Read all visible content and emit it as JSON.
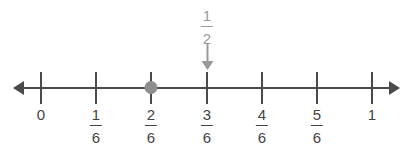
{
  "figure": {
    "type": "number-line",
    "background_color": "#ffffff",
    "axis_color": "#4a4a4a",
    "label_color": "#434343",
    "marker_color": "#8d8d8d",
    "callout_color": "#9a9a9a"
  },
  "axis": {
    "left_arrow": "left-arrow",
    "right_arrow": "right-arrow",
    "start_x": 41,
    "end_x": 372,
    "y": 88,
    "spacing": 55.2
  },
  "ticks": [
    {
      "x": 41,
      "is_fraction": false,
      "whole": "0",
      "numerator": "",
      "denominator": ""
    },
    {
      "x": 96,
      "is_fraction": true,
      "whole": "",
      "numerator": "1",
      "denominator": "6"
    },
    {
      "x": 151,
      "is_fraction": true,
      "whole": "",
      "numerator": "2",
      "denominator": "6"
    },
    {
      "x": 207,
      "is_fraction": true,
      "whole": "",
      "numerator": "3",
      "denominator": "6"
    },
    {
      "x": 262,
      "is_fraction": true,
      "whole": "",
      "numerator": "4",
      "denominator": "6"
    },
    {
      "x": 317,
      "is_fraction": true,
      "whole": "",
      "numerator": "5",
      "denominator": "6"
    },
    {
      "x": 372,
      "is_fraction": false,
      "whole": "1",
      "numerator": "",
      "denominator": ""
    }
  ],
  "point_marker": {
    "x": 151,
    "label": "2/6",
    "shape": "filled-circle"
  },
  "callout": {
    "x": 207,
    "numerator": "1",
    "denominator": "2",
    "points_to": "3/6",
    "arrow": "down-arrow"
  },
  "chart_data": {
    "type": "number-line",
    "title": "",
    "xlabel": "",
    "ylabel": "",
    "xlim": [
      0,
      1
    ],
    "tick_values": [
      0,
      0.16667,
      0.33333,
      0.5,
      0.66667,
      0.83333,
      1
    ],
    "tick_labels": [
      "0",
      "1/6",
      "2/6",
      "3/6",
      "4/6",
      "5/6",
      "1"
    ],
    "points": [
      {
        "value": 0.33333,
        "label": "2/6",
        "style": "gray-dot"
      }
    ],
    "annotations": [
      {
        "value": 0.5,
        "text": "1/2",
        "style": "gray-label-with-down-arrow"
      }
    ],
    "grid": false,
    "legend": "none"
  }
}
